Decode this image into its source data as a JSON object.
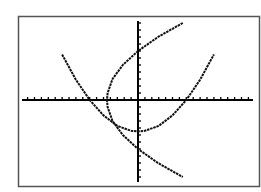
{
  "chart_data": {
    "type": "line",
    "title": "",
    "xlabel": "",
    "ylabel": "",
    "grid": false,
    "legend": "none",
    "axis_ticks": true,
    "xlim": [
      -17,
      17
    ],
    "ylim": [
      -12,
      12
    ],
    "tick_spacing": 1,
    "series": [
      {
        "name": "upward-parabola",
        "description": "y = (x^2)/11 - 4.5 (approx.)",
        "points": [
          [
            -11,
            6.5
          ],
          [
            -9,
            2.9
          ],
          [
            -7,
            0
          ],
          [
            -5,
            -2.2
          ],
          [
            -3,
            -3.7
          ],
          [
            -1,
            -4.4
          ],
          [
            0,
            -4.5
          ],
          [
            1,
            -4.4
          ],
          [
            3,
            -3.7
          ],
          [
            5,
            -2.2
          ],
          [
            7,
            0
          ],
          [
            9,
            2.9
          ],
          [
            11,
            6.5
          ]
        ]
      },
      {
        "name": "sideways-parabola",
        "description": "x = (y^2)/11 - 4.5 (inverse relation)",
        "points": [
          [
            6.5,
            11
          ],
          [
            2.9,
            9
          ],
          [
            0,
            7
          ],
          [
            -2.2,
            5
          ],
          [
            -3.7,
            3
          ],
          [
            -4.4,
            1
          ],
          [
            -4.5,
            0
          ],
          [
            -4.4,
            -1
          ],
          [
            -3.7,
            -3
          ],
          [
            -2.2,
            -5
          ],
          [
            0,
            -7
          ],
          [
            2.9,
            -9
          ],
          [
            6.5,
            -11
          ]
        ]
      }
    ]
  },
  "frame": {
    "stroke": "#555555"
  },
  "colors": {
    "curve": "#111111",
    "axis": "#000000",
    "background": "#ffffff"
  }
}
